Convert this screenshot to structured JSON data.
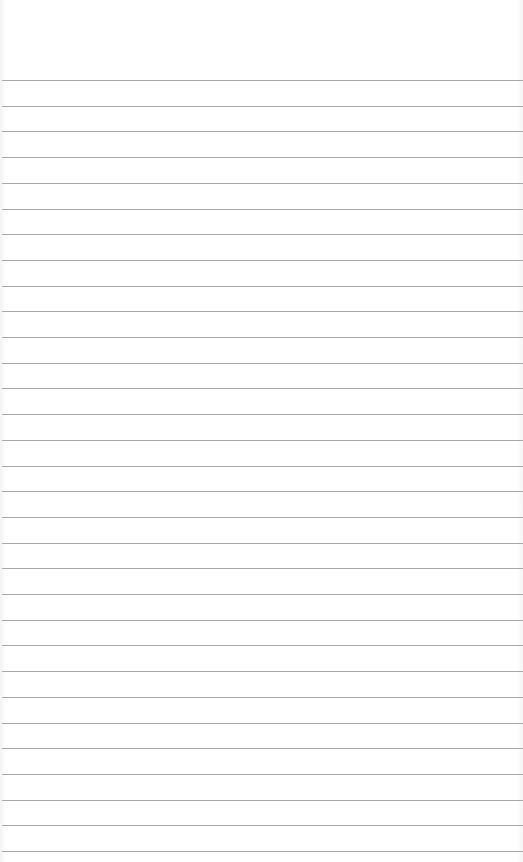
{
  "page": {
    "type": "blank ruled notebook paper",
    "line_count": 31,
    "colors": {
      "paper": "#ffffff",
      "rule": "#9a9a9a"
    }
  }
}
